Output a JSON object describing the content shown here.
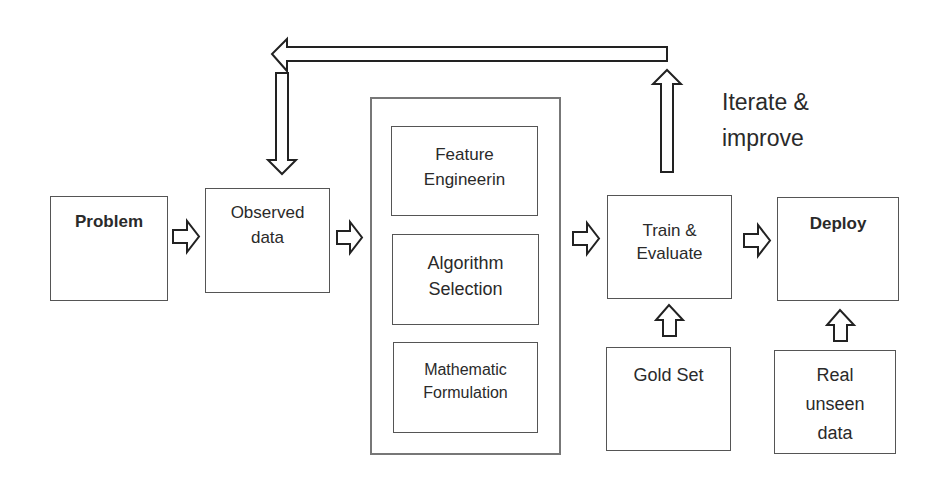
{
  "diagram": {
    "nodes": {
      "problem": {
        "label": "Problem"
      },
      "observed": {
        "line1": "Observed",
        "line2": "data"
      },
      "feature": {
        "line1": "Feature",
        "line2": "Engineerin"
      },
      "algorithm": {
        "line1": "Algorithm",
        "line2": "Selection"
      },
      "math": {
        "line1": "Mathematic",
        "line2": "Formulation"
      },
      "train": {
        "line1": "Train &",
        "line2": "Evaluate"
      },
      "deploy": {
        "label": "Deploy"
      },
      "gold": {
        "label": "Gold Set"
      },
      "real": {
        "line1": "Real",
        "line2": "unseen",
        "line3": "data"
      }
    },
    "annotation": {
      "line1": "Iterate &",
      "line2": "improve"
    },
    "edges": [
      {
        "from": "problem",
        "to": "observed"
      },
      {
        "from": "observed",
        "to": "modeling-group"
      },
      {
        "from": "modeling-group",
        "to": "train"
      },
      {
        "from": "train",
        "to": "deploy"
      },
      {
        "from": "gold",
        "to": "train"
      },
      {
        "from": "real",
        "to": "deploy"
      },
      {
        "from": "train",
        "to": "observed",
        "label": "Iterate & improve"
      }
    ]
  }
}
